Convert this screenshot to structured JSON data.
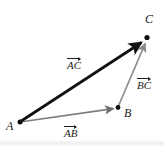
{
  "figure": {
    "type": "vector-triangle-diagram",
    "background_color": "#ffffff",
    "width": 164,
    "height": 146
  },
  "points": [
    {
      "id": "A",
      "label": "A",
      "x": 20,
      "y": 122,
      "label_x": 6,
      "label_y": 120
    },
    {
      "id": "B",
      "label": "B",
      "x": 118,
      "y": 108,
      "label_x": 124,
      "label_y": 107
    },
    {
      "id": "C",
      "label": "C",
      "x": 147,
      "y": 38,
      "label_x": 145,
      "label_y": 13
    }
  ],
  "vectors": [
    {
      "id": "AC",
      "label": "AC",
      "from": "A",
      "to": "C",
      "color": "#111111",
      "width": 2.8,
      "label_x": 67,
      "label_y": 56
    },
    {
      "id": "AB",
      "label": "AB",
      "from": "A",
      "to": "B",
      "color": "#7d7d7d",
      "width": 1.8,
      "label_x": 64,
      "label_y": 124
    },
    {
      "id": "BC",
      "label": "BC",
      "from": "B",
      "to": "C",
      "color": "#8c8c8c",
      "width": 1.8,
      "label_x": 137,
      "label_y": 76
    }
  ],
  "colors": {
    "resultant": "#111111",
    "component": "#808080",
    "point": "#0d0d0d",
    "text": "#161616"
  }
}
